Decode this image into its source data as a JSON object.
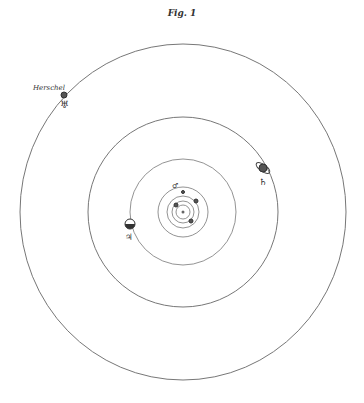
{
  "figure": {
    "title": "Fig. 1",
    "center": {
      "x": 183,
      "y": 212
    },
    "stroke_color": "#777777",
    "orbits": [
      {
        "name": "Herschel",
        "rx": 163,
        "ry": 168
      },
      {
        "name": "Saturn",
        "rx": 95,
        "ry": 95
      },
      {
        "name": "Jupiter",
        "rx": 53,
        "ry": 53
      },
      {
        "name": "Mars",
        "rx": 25,
        "ry": 25
      },
      {
        "name": "Earth",
        "rx": 16,
        "ry": 16
      },
      {
        "name": "Venus",
        "rx": 11,
        "ry": 11
      },
      {
        "name": "Mercury",
        "rx": 7,
        "ry": 7
      }
    ],
    "planets": [
      {
        "name": "Herschel",
        "label": "Herschel",
        "symbol": "♅",
        "x": 64,
        "y": 95,
        "r": 3
      },
      {
        "name": "Saturn",
        "symbol": "♄",
        "x": 263,
        "y": 168,
        "r": 4
      },
      {
        "name": "Jupiter",
        "symbol": "♃",
        "x": 130,
        "y": 224,
        "r": 5
      },
      {
        "name": "Mars",
        "symbol": "♂",
        "x": 183,
        "y": 192,
        "r": 1.5
      },
      {
        "name": "Earth",
        "x": 196,
        "y": 201,
        "r": 2
      },
      {
        "name": "Venus",
        "x": 176,
        "y": 205,
        "r": 2
      },
      {
        "name": "Mercury",
        "x": 191,
        "y": 221,
        "r": 2
      }
    ],
    "labels": {
      "herschel_name": "Herschel",
      "herschel_symbol": "♅",
      "saturn_symbol": "♄",
      "jupiter_symbol": "♃",
      "mars_symbol": "♂"
    }
  }
}
